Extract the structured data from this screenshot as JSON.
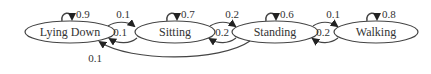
{
  "diagram": {
    "type": "markov-chain-state-diagram",
    "colors": {
      "stroke": "#444444",
      "text": "#333333",
      "arrowhead": "#222222",
      "background": "#ffffff"
    },
    "nodes": [
      {
        "id": "lying_down",
        "label": "Lying Down",
        "self_loop": "0.9"
      },
      {
        "id": "sitting",
        "label": "Sitting",
        "self_loop": "0.7"
      },
      {
        "id": "standing",
        "label": "Standing",
        "self_loop": "0.6"
      },
      {
        "id": "walking",
        "label": "Walking",
        "self_loop": "0.8"
      }
    ],
    "edges": [
      {
        "from": "lying_down",
        "to": "sitting",
        "label": "0.1"
      },
      {
        "from": "sitting",
        "to": "lying_down",
        "label": "0.1"
      },
      {
        "from": "sitting",
        "to": "standing",
        "label": "0.2"
      },
      {
        "from": "standing",
        "to": "sitting",
        "label": "0.2"
      },
      {
        "from": "standing",
        "to": "walking",
        "label": "0.1"
      },
      {
        "from": "walking",
        "to": "standing",
        "label": "0.2"
      },
      {
        "from": "standing",
        "to": "lying_down",
        "label": "0.1"
      }
    ]
  }
}
